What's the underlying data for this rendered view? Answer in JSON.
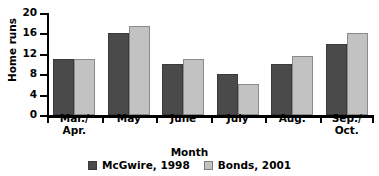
{
  "chart_data": {
    "type": "bar",
    "title": "",
    "xlabel": "Month",
    "ylabel": "Home runs",
    "categories": [
      "Mar./\nApr.",
      "May",
      "June",
      "July",
      "Aug.",
      "Sep./\nOct."
    ],
    "ylim": [
      0,
      20
    ],
    "yticks": [
      0,
      4,
      8,
      12,
      16,
      20
    ],
    "ytick_labels": [
      "0",
      "4",
      "8",
      "12",
      "16",
      "20"
    ],
    "grid": false,
    "legend_position": "bottom-center",
    "series": [
      {
        "name": "McGwire, 1998",
        "color": "#4a4a4a",
        "values": [
          11,
          16,
          10,
          8,
          10,
          14
        ]
      },
      {
        "name": "Bonds, 2001",
        "color": "#c2c2c2",
        "values": [
          11,
          17.5,
          11,
          6,
          11.5,
          16
        ]
      }
    ]
  }
}
